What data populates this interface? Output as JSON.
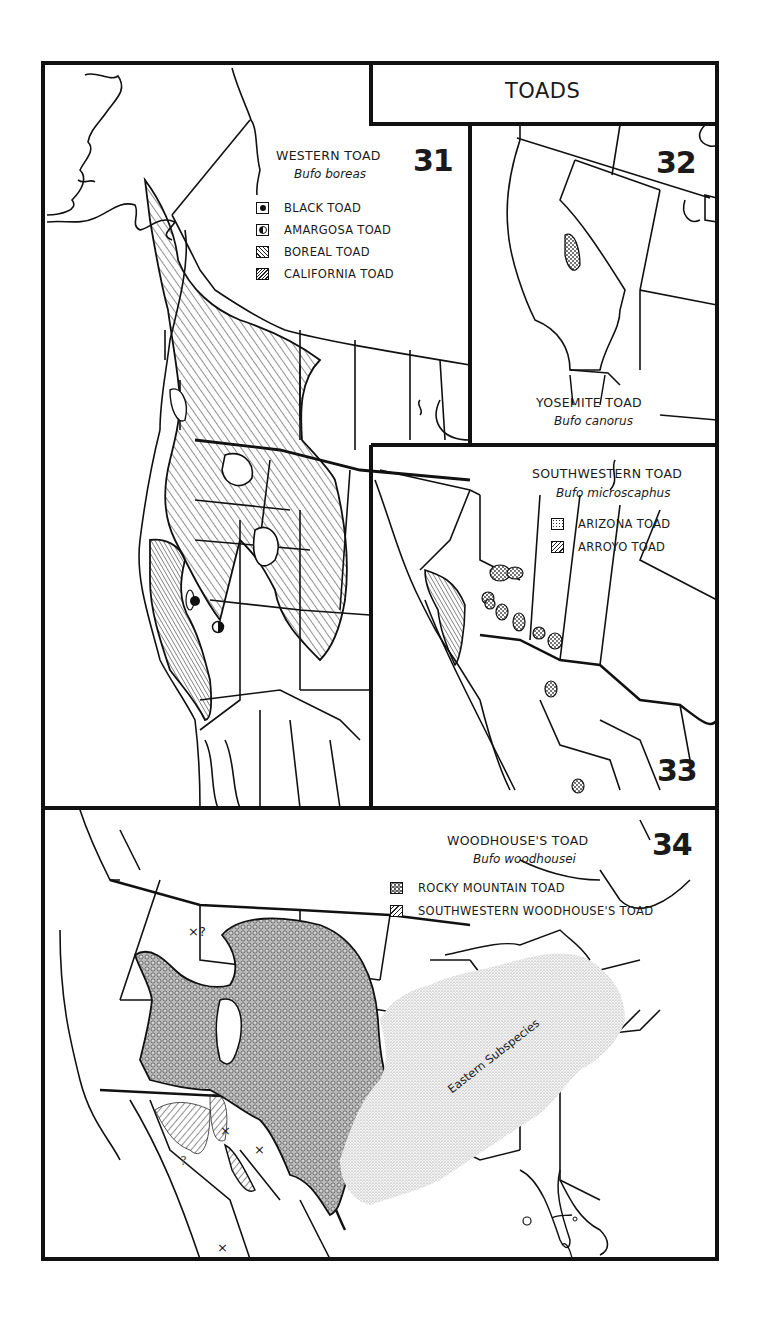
{
  "page": {
    "title": "TOADS"
  },
  "maps": [
    {
      "number": "31",
      "common_name": "WESTERN TOAD",
      "scientific_name": "Bufo boreas",
      "legend": [
        {
          "label": "BLACK TOAD",
          "symbol": "filled-circle"
        },
        {
          "label": "AMARGOSA TOAD",
          "symbol": "half-filled-circle"
        },
        {
          "label": "BOREAL TOAD",
          "symbol": "light-hatch"
        },
        {
          "label": "CALIFORNIA TOAD",
          "symbol": "dense-hatch"
        }
      ]
    },
    {
      "number": "32",
      "common_name": "YOSEMITE TOAD",
      "scientific_name": "Bufo canorus",
      "legend": []
    },
    {
      "number": "33",
      "common_name": "SOUTHWESTERN TOAD",
      "scientific_name": "Bufo microscaphus",
      "legend": [
        {
          "label": "ARIZONA TOAD",
          "symbol": "stipple"
        },
        {
          "label": "ARROYO TOAD",
          "symbol": "hatch"
        }
      ]
    },
    {
      "number": "34",
      "common_name": "WOODHOUSE'S TOAD",
      "scientific_name": "Bufo woodhousei",
      "legend": [
        {
          "label": "ROCKY MOUNTAIN TOAD",
          "symbol": "circle-dots"
        },
        {
          "label": "SOUTHWESTERN WOODHOUSE'S TOAD",
          "symbol": "hatch"
        }
      ],
      "annotations": {
        "region_label": "Eastern Subspecies",
        "uncertain_marks": [
          "×?",
          "?"
        ],
        "isolated_marks": [
          "×",
          "×",
          "×"
        ]
      }
    }
  ]
}
